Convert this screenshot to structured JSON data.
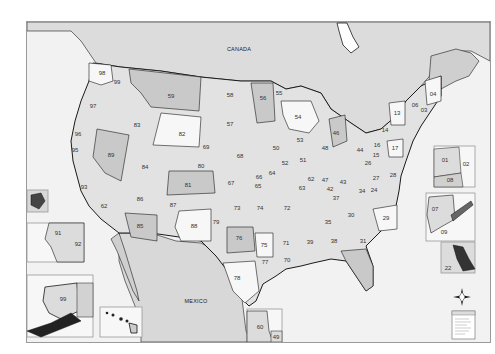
{
  "map": {
    "labels": {
      "canada": "CANADA",
      "mexico": "MEXICO"
    },
    "colors": {
      "frame_border": "#9a9a9a",
      "background_land_foreign": "#dcdcdc",
      "water": "#f2f2f2",
      "region_light": "#f7f7f7",
      "region_mid": "#e2e2e2",
      "region_dark": "#c9c9c9",
      "outline": "#1a1a1a"
    },
    "regions": [
      {
        "id": "98",
        "x": 101,
        "y": 73,
        "shade": "light"
      },
      {
        "id": "99",
        "x": 115,
        "y": 82,
        "shade": "mid"
      },
      {
        "id": "97",
        "x": 92,
        "y": 106,
        "shade": "mid"
      },
      {
        "id": "59",
        "x": 170,
        "y": 96,
        "shade": "dark"
      },
      {
        "id": "58",
        "x": 229,
        "y": 95,
        "shade": "mid"
      },
      {
        "id": "57",
        "x": 229,
        "y": 124,
        "shade": "light"
      },
      {
        "id": "56",
        "x": 262,
        "y": 98,
        "shade": "dark"
      },
      {
        "id": "55",
        "x": 277,
        "y": 93,
        "shade": "mid"
      },
      {
        "id": "54",
        "x": 297,
        "y": 117,
        "shade": "light"
      },
      {
        "id": "83",
        "x": 136,
        "y": 125,
        "shade": "mid"
      },
      {
        "id": "82",
        "x": 181,
        "y": 134,
        "shade": "light"
      },
      {
        "id": "96",
        "x": 77,
        "y": 134,
        "shade": "mid"
      },
      {
        "id": "95",
        "x": 74,
        "y": 150,
        "shade": "light"
      },
      {
        "id": "89",
        "x": 110,
        "y": 155,
        "shade": "dark"
      },
      {
        "id": "84",
        "x": 144,
        "y": 167,
        "shade": "mid"
      },
      {
        "id": "69",
        "x": 205,
        "y": 147,
        "shade": "dark"
      },
      {
        "id": "80",
        "x": 200,
        "y": 166,
        "shade": "mid"
      },
      {
        "id": "68",
        "x": 239,
        "y": 156,
        "shade": "mid"
      },
      {
        "id": "81",
        "x": 187,
        "y": 185,
        "shade": "dark"
      },
      {
        "id": "67",
        "x": 230,
        "y": 183,
        "shade": "mid"
      },
      {
        "id": "66",
        "x": 258,
        "y": 177,
        "shade": "dark"
      },
      {
        "id": "93",
        "x": 83,
        "y": 187,
        "shade": "mid"
      },
      {
        "id": "62",
        "x": 103,
        "y": 206,
        "shade": "light"
      },
      {
        "id": "86",
        "x": 139,
        "y": 199,
        "shade": "mid"
      },
      {
        "id": "87",
        "x": 172,
        "y": 205,
        "shade": "mid"
      },
      {
        "id": "85",
        "x": 139,
        "y": 226,
        "shade": "dark"
      },
      {
        "id": "88",
        "x": 193,
        "y": 226,
        "shade": "light"
      },
      {
        "id": "79",
        "x": 215,
        "y": 222,
        "shade": "mid"
      },
      {
        "id": "73",
        "x": 236,
        "y": 208,
        "shade": "mid"
      },
      {
        "id": "74",
        "x": 259,
        "y": 208,
        "shade": "mid"
      },
      {
        "id": "72",
        "x": 286,
        "y": 208,
        "shade": "mid"
      },
      {
        "id": "76",
        "x": 238,
        "y": 238,
        "shade": "dark"
      },
      {
        "id": "75",
        "x": 263,
        "y": 245,
        "shade": "light"
      },
      {
        "id": "71",
        "x": 285,
        "y": 243,
        "shade": "mid"
      },
      {
        "id": "77",
        "x": 264,
        "y": 262,
        "shade": "mid"
      },
      {
        "id": "70",
        "x": 286,
        "y": 260,
        "shade": "dark"
      },
      {
        "id": "78",
        "x": 236,
        "y": 278,
        "shade": "light"
      },
      {
        "id": "39",
        "x": 309,
        "y": 242,
        "shade": "mid"
      },
      {
        "id": "38",
        "x": 333,
        "y": 241,
        "shade": "mid"
      },
      {
        "id": "35",
        "x": 327,
        "y": 222,
        "shade": "dark"
      },
      {
        "id": "36",
        "x": 338,
        "y": 218,
        "shade": "light"
      },
      {
        "id": "30",
        "x": 350,
        "y": 215,
        "shade": "mid"
      },
      {
        "id": "31",
        "x": 362,
        "y": 241,
        "shade": "mid"
      },
      {
        "id": "32",
        "x": 357,
        "y": 256,
        "shade": "dark"
      },
      {
        "id": "29",
        "x": 385,
        "y": 218,
        "shade": "light"
      },
      {
        "id": "50",
        "x": 275,
        "y": 148,
        "shade": "mid"
      },
      {
        "id": "52",
        "x": 284,
        "y": 163,
        "shade": "dark"
      },
      {
        "id": "53",
        "x": 299,
        "y": 140,
        "shade": "mid"
      },
      {
        "id": "51",
        "x": 302,
        "y": 160,
        "shade": "mid"
      },
      {
        "id": "64",
        "x": 271,
        "y": 173,
        "shade": "light"
      },
      {
        "id": "65",
        "x": 257,
        "y": 186,
        "shade": "mid"
      },
      {
        "id": "63",
        "x": 301,
        "y": 188,
        "shade": "mid"
      },
      {
        "id": "62b",
        "x": 310,
        "y": 179,
        "shade": "mid"
      },
      {
        "id": "48",
        "x": 324,
        "y": 148,
        "shade": "light"
      },
      {
        "id": "46",
        "x": 335,
        "y": 133,
        "shade": "dark"
      },
      {
        "id": "47",
        "x": 324,
        "y": 180,
        "shade": "mid"
      },
      {
        "id": "42",
        "x": 329,
        "y": 189,
        "shade": "dark"
      },
      {
        "id": "43",
        "x": 342,
        "y": 182,
        "shade": "mid"
      },
      {
        "id": "37",
        "x": 335,
        "y": 198,
        "shade": "mid"
      },
      {
        "id": "44",
        "x": 359,
        "y": 150,
        "shade": "mid"
      },
      {
        "id": "45",
        "x": 351,
        "y": 176,
        "shade": "mid"
      },
      {
        "id": "34",
        "x": 361,
        "y": 191,
        "shade": "mid"
      },
      {
        "id": "27",
        "x": 375,
        "y": 178,
        "shade": "mid"
      },
      {
        "id": "26",
        "x": 367,
        "y": 163,
        "shade": "light"
      },
      {
        "id": "28",
        "x": 392,
        "y": 175,
        "shade": "mid"
      },
      {
        "id": "24",
        "x": 373,
        "y": 190,
        "shade": "mid"
      },
      {
        "id": "16",
        "x": 376,
        "y": 145,
        "shade": "dark"
      },
      {
        "id": "15",
        "x": 375,
        "y": 155,
        "shade": "mid"
      },
      {
        "id": "14",
        "x": 384,
        "y": 130,
        "shade": "mid"
      },
      {
        "id": "17",
        "x": 394,
        "y": 148,
        "shade": "light"
      },
      {
        "id": "13",
        "x": 396,
        "y": 113,
        "shade": "light"
      },
      {
        "id": "06",
        "x": 414,
        "y": 105,
        "shade": "dark"
      },
      {
        "id": "03",
        "x": 423,
        "y": 110,
        "shade": "mid"
      },
      {
        "id": "04",
        "x": 432,
        "y": 94,
        "shade": "light"
      }
    ],
    "insets": [
      {
        "name": "inset-southern-california",
        "labels": [
          "91",
          "92"
        ]
      },
      {
        "name": "inset-alaska",
        "labels": [
          "99"
        ]
      },
      {
        "name": "inset-hawaii",
        "labels": []
      },
      {
        "name": "inset-san-francisco-bay",
        "labels": []
      },
      {
        "name": "inset-new-england",
        "labels": [
          "01",
          "02",
          "08"
        ]
      },
      {
        "name": "inset-mid-atlantic",
        "labels": [
          "07",
          "09"
        ]
      },
      {
        "name": "inset-chesapeake",
        "labels": [
          "22"
        ]
      },
      {
        "name": "inset-south-florida",
        "labels": [
          "60",
          "49"
        ]
      }
    ],
    "legend_title": "",
    "compass": "N"
  }
}
